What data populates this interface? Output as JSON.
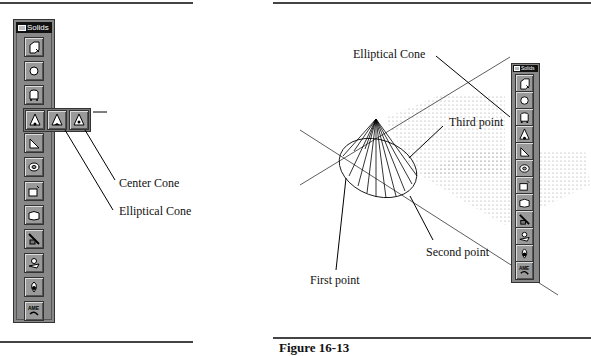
{
  "left_figure": {
    "toolbar_title": "Solids",
    "flyout_labels": [
      "Center Cone",
      "Elliptical Cone"
    ],
    "buttons": [
      "box-icon",
      "sphere-icon",
      "cylinder-icon",
      "cone-icon",
      "wedge-icon",
      "torus-icon",
      "extrude-icon",
      "revolve-icon",
      "slice-icon",
      "section-icon",
      "interfere-icon",
      "ame-convert-icon"
    ]
  },
  "right_figure": {
    "toolbar_title": "Solids",
    "labels": {
      "elliptical_cone": "Elliptical Cone",
      "third_point": "Third point",
      "second_point": "Second point",
      "first_point": "First point"
    }
  },
  "caption": "Figure 16-13"
}
